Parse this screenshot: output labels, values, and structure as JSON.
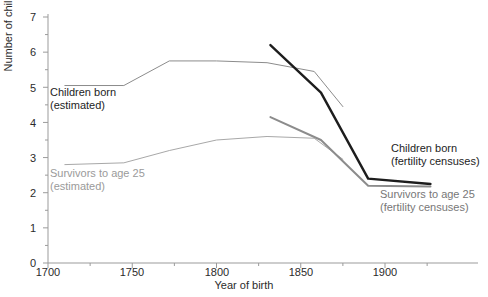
{
  "chart_data": {
    "type": "line",
    "title": "",
    "xlabel": "Year of birth",
    "ylabel": "Number of children",
    "xlim": [
      1700,
      1930
    ],
    "ylim": [
      0,
      7
    ],
    "grid": false,
    "legend_position": "inline-annotations",
    "x_ticks_major": [
      1700,
      1750,
      1800,
      1850,
      1900
    ],
    "x_ticks_minor": [
      1725,
      1775,
      1825,
      1875,
      1925
    ],
    "x_tick_labels": [
      "1700",
      "1750",
      "1800",
      "1850",
      "1900"
    ],
    "y_ticks_major": [
      0,
      1,
      2,
      3,
      4,
      5,
      6,
      7
    ],
    "y_ticks_minor": [
      0.5,
      1.5,
      2.5,
      3.5,
      4.5,
      5.5,
      6.5
    ],
    "y_tick_labels": [
      "0",
      "1",
      "2",
      "3",
      "4",
      "5",
      "6",
      "7"
    ],
    "series": [
      {
        "name": "Children born (estimated)",
        "color": "#8c8c8c",
        "width": 1,
        "x": [
          1710,
          1745,
          1772,
          1800,
          1830,
          1858,
          1875
        ],
        "values": [
          5.05,
          5.05,
          5.75,
          5.75,
          5.7,
          5.45,
          4.45
        ]
      },
      {
        "name": "Survivors to age 25 (estimated)",
        "color": "#a8a8a8",
        "width": 1,
        "x": [
          1710,
          1745,
          1772,
          1800,
          1830,
          1858,
          1875
        ],
        "values": [
          2.8,
          2.85,
          3.2,
          3.5,
          3.6,
          3.55,
          2.95
        ]
      },
      {
        "name": "Children born (fertility censuses)",
        "color": "#1d1d1d",
        "width": 2.4,
        "x": [
          1832,
          1862,
          1890,
          1927
        ],
        "values": [
          6.2,
          4.85,
          2.4,
          2.25
        ]
      },
      {
        "name": "Survivors to age 25 (fertility censuses)",
        "color": "#8c8c8c",
        "width": 2.0,
        "x": [
          1832,
          1862,
          1890,
          1927
        ],
        "values": [
          4.15,
          3.5,
          2.2,
          2.18
        ]
      }
    ],
    "annotations": [
      {
        "name": "children-born-estimated",
        "lines": [
          "Children born",
          "(estimated)"
        ],
        "color": "#1d1d1d"
      },
      {
        "name": "survivors-estimated",
        "lines": [
          "Survivors to age 25",
          "(estimated)"
        ],
        "color": "#9a9a9a"
      },
      {
        "name": "children-born-fertility-censuses",
        "lines": [
          "Children born",
          "(fertility censuses)"
        ],
        "color": "#1d1d1d"
      },
      {
        "name": "survivors-fertility-censuses",
        "lines": [
          "Survivors to age 25",
          "(fertility censuses)"
        ],
        "color": "#8c8c8c"
      }
    ]
  },
  "axes": {
    "y_title": "Number of children",
    "x_title": "Year of birth",
    "y_labels": {
      "t0": "0",
      "t1": "1",
      "t2": "2",
      "t3": "3",
      "t4": "4",
      "t5": "5",
      "t6": "6",
      "t7": "7"
    },
    "x_labels": {
      "t1700": "1700",
      "t1750": "1750",
      "t1800": "1800",
      "t1850": "1850",
      "t1900": "1900"
    }
  },
  "annotations": {
    "cb_est_line1": "Children born",
    "cb_est_line2": "(estimated)",
    "sv_est_line1": "Survivors to age 25",
    "sv_est_line2": "(estimated)",
    "cb_fc_line1": "Children born",
    "cb_fc_line2": "(fertility censuses)",
    "sv_fc_line1": "Survivors to age 25",
    "sv_fc_line2": "(fertility censuses)"
  },
  "colors": {
    "axis": "#9b9b9b",
    "dark_series": "#1d1d1d",
    "grey_series": "#8c8c8c",
    "light_series": "#a8a8a8",
    "text": "#2b2b2b",
    "muted_text": "#9a9a9a"
  }
}
